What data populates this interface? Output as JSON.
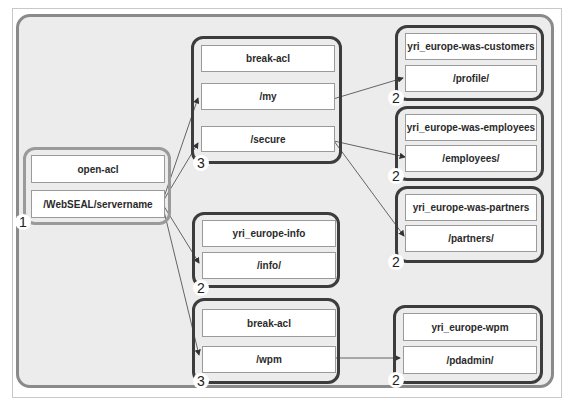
{
  "diagram": {
    "nodes": [
      {
        "id": "root",
        "rows": [
          "open-acl",
          "/WebSEAL/servername"
        ],
        "badge": "1"
      },
      {
        "id": "g_my_secure",
        "rows": [
          "break-acl",
          "/my",
          "/secure"
        ],
        "badge": "3"
      },
      {
        "id": "g_info",
        "rows": [
          "yri_europe-info",
          "/info/"
        ],
        "badge": "2"
      },
      {
        "id": "g_wpm",
        "rows": [
          "break-acl",
          "/wpm"
        ],
        "badge": "3"
      },
      {
        "id": "g_customers",
        "rows": [
          "yri_europe-was-customers",
          "/profile/"
        ],
        "badge": "2"
      },
      {
        "id": "g_employees",
        "rows": [
          "yri_europe-was-employees",
          "/employees/"
        ],
        "badge": "2"
      },
      {
        "id": "g_partners",
        "rows": [
          "yri_europe-was-partners",
          "/partners/"
        ],
        "badge": "2"
      },
      {
        "id": "g_pdadmin",
        "rows": [
          "yri_europe-wpm",
          "/pdadmin/"
        ],
        "badge": "2"
      }
    ],
    "edges": [
      {
        "from": "/WebSEAL/servername",
        "to": "/my"
      },
      {
        "from": "/WebSEAL/servername",
        "to": "/secure"
      },
      {
        "from": "/WebSEAL/servername",
        "to": "/info/"
      },
      {
        "from": "/WebSEAL/servername",
        "to": "/wpm"
      },
      {
        "from": "/my",
        "to": "/profile/"
      },
      {
        "from": "/secure",
        "to": "/employees/"
      },
      {
        "from": "/secure",
        "to": "/partners/"
      },
      {
        "from": "/wpm",
        "to": "/pdadmin/"
      }
    ],
    "colors": {
      "background": "#ececec",
      "outer_border": "#8a8a8a",
      "root_group_border": "#9a9a9a",
      "group_border": "#3c3c3c",
      "cell_fill": "#ffffff",
      "edge": "#555555"
    }
  }
}
